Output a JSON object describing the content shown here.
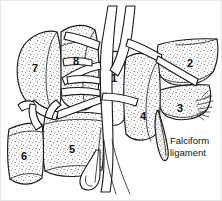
{
  "figure": {
    "background_color": "#ffffff",
    "ink_color": "#1a1a1a",
    "stipple_color": "#2b2b2b",
    "width": 222,
    "height": 201
  },
  "segments": [
    {
      "id": "1",
      "label": "1",
      "x": 114,
      "y": 79
    },
    {
      "id": "2",
      "label": "2",
      "x": 190,
      "y": 64
    },
    {
      "id": "3",
      "label": "3",
      "x": 180,
      "y": 109
    },
    {
      "id": "4",
      "label": "4",
      "x": 143,
      "y": 117
    },
    {
      "id": "5",
      "label": "5",
      "x": 72,
      "y": 150
    },
    {
      "id": "6",
      "label": "6",
      "x": 24,
      "y": 157
    },
    {
      "id": "7",
      "label": "7",
      "x": 35,
      "y": 69
    },
    {
      "id": "8",
      "label": "8",
      "x": 76,
      "y": 62
    }
  ],
  "annotations": [
    {
      "id": "falciform",
      "line1": "Falciform",
      "line2": "ligament",
      "x": 170,
      "y": 141
    }
  ]
}
